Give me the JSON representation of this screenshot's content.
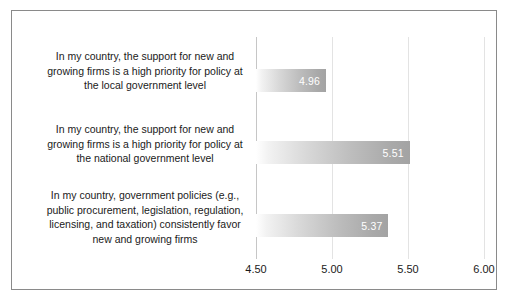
{
  "chart_data": {
    "type": "bar",
    "orientation": "horizontal",
    "title": "",
    "xlabel": "",
    "ylabel": "",
    "xlim": [
      4.5,
      6.0
    ],
    "grid": true,
    "legend": false,
    "tick_labels": [
      "4.50",
      "5.00",
      "5.50",
      "6.00"
    ],
    "tick_values": [
      4.5,
      5.0,
      5.5,
      6.0
    ],
    "categories": [
      "In my country, the support for new and growing firms is a high priority for policy at the local government level",
      "In my country, the support for new and growing firms is a high priority for policy at the national government level",
      "In my country, government policies (e.g., public procurement, legislation, regulation, licensing, and taxation) consistently favor new and growing firms"
    ],
    "category_lines": [
      [
        "In my country, the support for new and",
        "growing firms is a high priority for policy at",
        "the local government level"
      ],
      [
        "In my country, the support for new and",
        "growing firms is a high priority for policy at",
        "the national government level"
      ],
      [
        "In my country, government policies (e.g.,",
        "public procurement, legislation, regulation,",
        "licensing, and taxation) consistently favor",
        "new and growing firms"
      ]
    ],
    "values": [
      4.96,
      5.51,
      5.37
    ],
    "value_labels": [
      "4.96",
      "5.51",
      "5.37"
    ],
    "colors": {
      "bar_gradient_start": "#ffffff",
      "bar_gradient_end": "#a3a3a3",
      "value_label": "#ffffff",
      "gridline": "#e3e3e3",
      "axis_line": "#c6c6c6",
      "border": "#8a8a8a",
      "text": "#1a1a1a",
      "background": "#ffffff"
    }
  }
}
